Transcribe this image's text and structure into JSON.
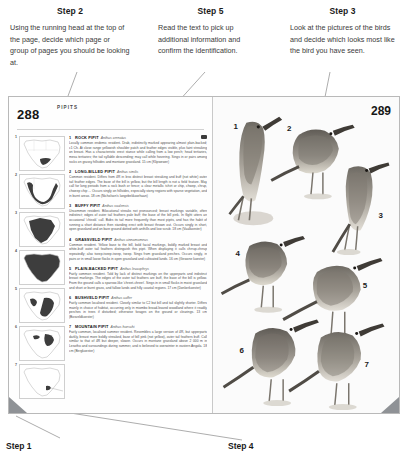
{
  "callouts": [
    {
      "id": "step2",
      "title": "Step 2",
      "body": "Using the running head at the top of the page, decide which page or group of pages you should be looking at."
    },
    {
      "id": "step5",
      "title": "Step 5",
      "body": "Read the text to pick up additional information and confirm the identification."
    },
    {
      "id": "step3",
      "title": "Step 3",
      "body": "Look at the pictures of the birds and decide which looks most like the bird you have seen."
    }
  ],
  "bottom_labels": [
    {
      "id": "step1",
      "title": "Step 1"
    },
    {
      "id": "step4",
      "title": "Step 4"
    }
  ],
  "book": {
    "left_page": {
      "folio": "288",
      "running_head": "PIPITS",
      "species": [
        {
          "num": "1",
          "name": "ROCK PIPIT",
          "scientific": "Anthus crenatus",
          "text": "Locally common endemic resident. Drab, indistinctly marked appearing almost plain-backed; c1 Ch. At close range yellowish shoulder patch and feather edges visible, plus faint streaking on breast. Has a characteristic erect stance while calling from a low perch; head tertiaries, mesa tertiaries; the tail syllable descending; may call while hovering. Sings in or pairs among rocks on grassy hillsides and montane grassland. 15 cm (Klipwewer)"
        },
        {
          "num": "2",
          "name": "LONG-BILLED PIPIT",
          "scientific": "Anthus similis",
          "text": "Common resident. Differs from 4R in less distinct breast streaking and buff (not white) outer tail feather edges. The base of the bill is yellow, but the bill length is not a field feature. May call for long periods from a rock bush or fence; a clear metallic tchirt or chip, chwep, chrup, chweep chip ... Occurs singly on hillsides, especially stony regions with sparse vegetation, and in burnt areas. 18 cm (Nicholson's langebekkoorhaan)"
        },
        {
          "num": "3",
          "name": "BUFFY PIPIT",
          "scientific": "Anthus vaalensis",
          "text": "Uncommon resident. Bilocational streaks not pronounced; breast markings variable, often indistinct; edges of outer tail feathers pale buff; the base of the bill pink. In flight utters an occasional 'chissik' call. Bobs its tail more frequently than most pipits, and has the habit of running a short distance then standing erect with breast thrown out. Occurs singly in short, open grassland and on bare ground dotted with anthills and low scrub. 18 cm (Vaalkoester)"
        },
        {
          "num": "4",
          "name": "GRASSVELD PIPIT",
          "scientific": "Anthus cinnamomeus",
          "text": "Common resident. Yellow base to the bill, bold facial markings, boldly marked breast and white-buff outer tail feathers distinguish this pipit. When displaying it calls chrrup-chrrup repeatedly; also tseep-tseep-tseep, tseep. Sings from grassland perches. Occurs singly, in pairs or in small loose flocks in open grassland and cultivated lands. 16 cm (Gewone koester)"
        },
        {
          "num": "5",
          "name": "PLAIN-BACKED PIPIT",
          "scientific": "Anthus leucophrys",
          "text": "Fairly common resident. Told by lack of distinct markings on the upperparts and indistinct breast markings. The edges of the outer tail feathers are buff, the base of the bill is yellow. From the ground calls a sparrow-like 'chreet-chreet'. Sings in in small flocks in moist grassland and short or burnt grass, and fallow lands and hilly coastal regions. 17 cm (Donkerkoester)"
        },
        {
          "num": "6",
          "name": "BUSHVELD PIPIT",
          "scientific": "Anthus caffer",
          "text": "Fairly common localised resident. Closely similar to C2 but bill and tail slightly shorter. Differs mainly in choice of habitat, occurring only in miombo broad-leaved woodland where it readily perches in trees if disturbed; otherwise forages on the ground or clearings. 13 cm (Bosveldkoester)"
        },
        {
          "num": "7",
          "name": "MOUNTAIN PIPIT",
          "scientific": "Anthus hoeschi",
          "text": "Fairly common, localised summer resident. Resembles a large version of 4R, but upperparts darkly, breast more boldly streaked, base of bill pink (not yellow), outer tail feathers buff. Call similar to that of 4R but deeper, slower. Occurs in montane grassland above 2 000 m in Lesotho and surroundings during summer, and is believed to overwinter in eastern Angola. 18 cm (Bergkoester)"
        }
      ]
    },
    "right_page": {
      "folio": "289",
      "bird_numbers": [
        "1",
        "2",
        "3",
        "4",
        "5",
        "6",
        "7"
      ]
    }
  },
  "colors": {
    "line": "#8a8a8a",
    "corner_tri": "#8f9296",
    "map_fill": "#3d3d3d",
    "text": "#3a3a3a"
  }
}
